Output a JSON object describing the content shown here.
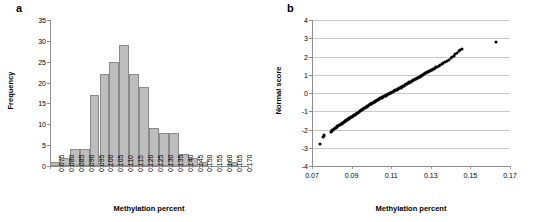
{
  "figure": {
    "panel_a_label": "a",
    "panel_b_label": "b"
  },
  "chart_data": [
    {
      "type": "bar",
      "panel": "a",
      "title": "",
      "xlabel": "Methylation percent",
      "ylabel": "Frequency",
      "ylim": [
        0,
        35
      ],
      "yticks": [
        0,
        5,
        10,
        15,
        20,
        25,
        30,
        35
      ],
      "grid": false,
      "legend": "none",
      "categories": [
        "0.075",
        "0.080",
        "0.085",
        "0.090",
        "0.095",
        "0.100",
        "0.105",
        "0.110",
        "0.115",
        "0.120",
        "0.125",
        "0.130",
        "0.135",
        "0.140",
        "0.145",
        "0.150",
        "0.155",
        "0.160",
        "0.165",
        "0.170"
      ],
      "values": [
        1,
        2,
        4,
        4,
        17,
        22,
        25,
        29,
        22,
        19,
        9,
        8,
        8,
        3,
        2,
        1,
        0,
        0,
        1,
        0
      ],
      "bar_fill": "#bdbdbd",
      "bar_stroke": "#8a8a8a"
    },
    {
      "type": "scatter",
      "panel": "b",
      "title": "",
      "xlabel": "Methylation percent",
      "ylabel": "Normal score",
      "xlim": [
        0.07,
        0.17
      ],
      "ylim": [
        -4,
        4
      ],
      "xticks": [
        "0.07",
        "0.09",
        "0.11",
        "0.13",
        "0.15",
        "0.17"
      ],
      "yticks": [
        -4,
        -3,
        -2,
        -1,
        0,
        1,
        2,
        3,
        4
      ],
      "grid": true,
      "legend": "none",
      "point_color": "#000000",
      "x": [
        0.0742,
        0.0757,
        0.0759,
        0.0762,
        0.0798,
        0.08,
        0.0803,
        0.0806,
        0.081,
        0.0815,
        0.082,
        0.0824,
        0.0828,
        0.0833,
        0.0838,
        0.0842,
        0.0846,
        0.085,
        0.0853,
        0.0857,
        0.086,
        0.0864,
        0.0867,
        0.087,
        0.0874,
        0.0877,
        0.088,
        0.0883,
        0.0886,
        0.0889,
        0.0892,
        0.0895,
        0.0898,
        0.0901,
        0.0905,
        0.0908,
        0.0912,
        0.0916,
        0.092,
        0.0924,
        0.0928,
        0.0932,
        0.0936,
        0.094,
        0.0944,
        0.0948,
        0.0952,
        0.0956,
        0.096,
        0.0964,
        0.0968,
        0.0972,
        0.0976,
        0.098,
        0.0984,
        0.0988,
        0.0992,
        0.0996,
        0.1,
        0.1004,
        0.1008,
        0.1012,
        0.1016,
        0.102,
        0.1024,
        0.1028,
        0.1032,
        0.1036,
        0.104,
        0.1044,
        0.1048,
        0.1052,
        0.1056,
        0.106,
        0.1064,
        0.1068,
        0.1072,
        0.1076,
        0.108,
        0.1084,
        0.1088,
        0.1092,
        0.1096,
        0.11,
        0.1104,
        0.1108,
        0.1112,
        0.1116,
        0.112,
        0.1124,
        0.1128,
        0.1132,
        0.1136,
        0.114,
        0.1144,
        0.1148,
        0.1152,
        0.1156,
        0.116,
        0.1164,
        0.1168,
        0.1172,
        0.1176,
        0.118,
        0.1184,
        0.1188,
        0.1192,
        0.1196,
        0.12,
        0.1204,
        0.1208,
        0.1213,
        0.1218,
        0.1223,
        0.1228,
        0.1233,
        0.1238,
        0.1243,
        0.1248,
        0.1253,
        0.1258,
        0.1263,
        0.1268,
        0.1273,
        0.1278,
        0.1283,
        0.1288,
        0.1293,
        0.1298,
        0.1303,
        0.1308,
        0.1313,
        0.1318,
        0.1323,
        0.1328,
        0.1333,
        0.134,
        0.1348,
        0.1356,
        0.1364,
        0.1372,
        0.138,
        0.139,
        0.14,
        0.1408,
        0.1416,
        0.1424,
        0.1432,
        0.144,
        0.1448,
        0.1456,
        0.163
      ],
      "y": [
        -2.8,
        -2.42,
        -2.36,
        -2.3,
        -2.12,
        -2.08,
        -2.04,
        -2.0,
        -1.96,
        -1.93,
        -1.9,
        -1.86,
        -1.83,
        -1.8,
        -1.77,
        -1.74,
        -1.71,
        -1.68,
        -1.66,
        -1.63,
        -1.6,
        -1.58,
        -1.55,
        -1.53,
        -1.5,
        -1.48,
        -1.45,
        -1.43,
        -1.41,
        -1.38,
        -1.36,
        -1.34,
        -1.32,
        -1.3,
        -1.27,
        -1.25,
        -1.22,
        -1.19,
        -1.16,
        -1.13,
        -1.1,
        -1.07,
        -1.04,
        -1.01,
        -0.98,
        -0.95,
        -0.92,
        -0.89,
        -0.86,
        -0.83,
        -0.8,
        -0.77,
        -0.74,
        -0.72,
        -0.69,
        -0.66,
        -0.63,
        -0.61,
        -0.58,
        -0.55,
        -0.53,
        -0.5,
        -0.48,
        -0.45,
        -0.43,
        -0.4,
        -0.38,
        -0.35,
        -0.33,
        -0.3,
        -0.28,
        -0.25,
        -0.23,
        -0.21,
        -0.18,
        -0.16,
        -0.14,
        -0.11,
        -0.09,
        -0.07,
        -0.04,
        -0.02,
        0.0,
        0.02,
        0.04,
        0.07,
        0.09,
        0.11,
        0.14,
        0.16,
        0.18,
        0.21,
        0.23,
        0.25,
        0.28,
        0.3,
        0.33,
        0.35,
        0.38,
        0.4,
        0.43,
        0.45,
        0.48,
        0.5,
        0.53,
        0.55,
        0.58,
        0.61,
        0.63,
        0.66,
        0.69,
        0.72,
        0.74,
        0.77,
        0.8,
        0.83,
        0.86,
        0.89,
        0.92,
        0.95,
        0.98,
        1.01,
        1.04,
        1.07,
        1.1,
        1.13,
        1.16,
        1.19,
        1.22,
        1.25,
        1.27,
        1.3,
        1.34,
        1.38,
        1.41,
        1.45,
        1.5,
        1.55,
        1.6,
        1.66,
        1.71,
        1.77,
        1.83,
        1.9,
        1.96,
        2.04,
        2.12,
        2.2,
        2.3,
        2.36,
        2.42,
        2.78
      ]
    }
  ]
}
